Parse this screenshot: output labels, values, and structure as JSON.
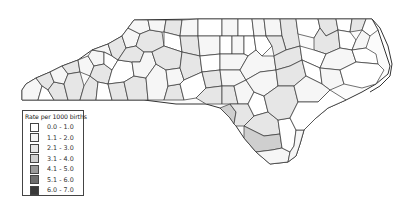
{
  "legend": {
    "title": "Rate per 1000 births",
    "items": [
      {
        "label": "0.0 - 1.0",
        "color": "#ffffff"
      },
      {
        "label": "1.1 - 2.0",
        "color": "#f4f4f4"
      },
      {
        "label": "2.1 - 3.0",
        "color": "#e6e6e6"
      },
      {
        "label": "3.1 - 4.0",
        "color": "#cfcfcf"
      },
      {
        "label": "4.1 - 5.0",
        "color": "#9a9a9a"
      },
      {
        "label": "5.1 - 6.0",
        "color": "#6e6e6e"
      },
      {
        "label": "6.0 - 7.0",
        "color": "#3a3a3a"
      }
    ]
  },
  "map": {
    "region": "North Carolina",
    "unit": "counties",
    "dominant_classes": [
      "0.0 - 1.0",
      "1.1 - 2.0",
      "2.1 - 3.0",
      "3.1 - 4.0"
    ]
  }
}
